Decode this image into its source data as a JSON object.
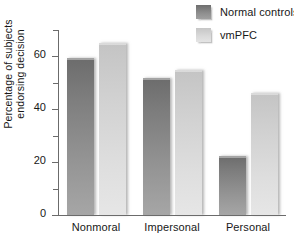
{
  "chart_data": {
    "type": "bar",
    "title": "",
    "xlabel": "",
    "ylabel": "Percentage of subjects endorsing decision",
    "ylabel_line1": "Percentage of subjects",
    "ylabel_line2": "endorsing decision",
    "categories": [
      "Nonmoral",
      "Impersonal",
      "Personal"
    ],
    "series": [
      {
        "name": "Normal controls",
        "values": [
          59.5,
          52.0,
          22.5
        ],
        "color": "#7d7d7d"
      },
      {
        "name": "vmPFC",
        "values": [
          65.0,
          55.0,
          46.0
        ],
        "color": "#d4d4d4"
      }
    ],
    "ylim": [
      0,
      70
    ],
    "yticks": [
      0,
      20,
      40,
      60
    ],
    "ytick_labels": [
      "0",
      "20",
      "40",
      "60"
    ],
    "yticks_minor": [
      10,
      30,
      50,
      70
    ],
    "grid": false,
    "legend_position": "top-right"
  },
  "legend": {
    "items": [
      {
        "label": "Normal controls",
        "swatch": "dark-gray-swatch"
      },
      {
        "label": "vmPFC",
        "swatch": "light-gray-swatch"
      }
    ]
  }
}
